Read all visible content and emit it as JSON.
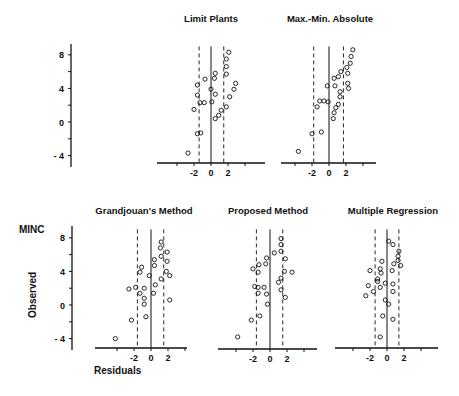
{
  "figure": {
    "ylabel": "Observed",
    "xlabel": "Residuals",
    "corner_label": "MINC",
    "y_ticks": [
      "8",
      "4",
      "0",
      "- 4"
    ],
    "x_ticks": [
      "-2",
      "0",
      "2"
    ]
  },
  "chart_data": [
    {
      "type": "scatter",
      "title": "Limit  Plants",
      "xlabel": "Residuals",
      "ylabel": "Observed",
      "xlim": [
        -6,
        6
      ],
      "ylim": [
        -5,
        9
      ],
      "x_ticks": [
        -2,
        0,
        2
      ],
      "y_ticks": [
        -4,
        0,
        4,
        8
      ],
      "dashed_bounds": [
        -1.4,
        1.5
      ],
      "points": [
        [
          2.1,
          8.3
        ],
        [
          1.8,
          7.5
        ],
        [
          1.8,
          6.6
        ],
        [
          1.8,
          5.7
        ],
        [
          2.9,
          4.6
        ],
        [
          2.7,
          3.9
        ],
        [
          2.2,
          3.0
        ],
        [
          0.5,
          5.8
        ],
        [
          0.4,
          5.2
        ],
        [
          -0.7,
          5.1
        ],
        [
          -1.6,
          4.4
        ],
        [
          0.0,
          3.9
        ],
        [
          0.5,
          3.3
        ],
        [
          -1.6,
          3.2
        ],
        [
          -1.3,
          2.3
        ],
        [
          -0.8,
          2.3
        ],
        [
          0.1,
          2.4
        ],
        [
          -2.0,
          1.5
        ],
        [
          1.8,
          1.8
        ],
        [
          1.2,
          1.4
        ],
        [
          0.9,
          0.8
        ],
        [
          0.5,
          0.4
        ],
        [
          -1.6,
          -1.4
        ],
        [
          -1.2,
          -1.3
        ],
        [
          -2.7,
          -3.7
        ]
      ]
    },
    {
      "type": "scatter",
      "title": "Max.-Min. Absolute",
      "xlabel": "Residuals",
      "ylabel": "Observed",
      "xlim": [
        -6,
        6
      ],
      "ylim": [
        -5,
        9
      ],
      "x_ticks": [
        -2,
        0,
        2
      ],
      "y_ticks": [
        -4,
        0,
        4,
        8
      ],
      "dashed_bounds": [
        -1.8,
        1.7
      ],
      "points": [
        [
          2.8,
          8.6
        ],
        [
          2.6,
          7.8
        ],
        [
          2.5,
          7.0
        ],
        [
          2.1,
          6.5
        ],
        [
          1.4,
          6.0
        ],
        [
          2.2,
          5.8
        ],
        [
          1.1,
          5.4
        ],
        [
          0.6,
          5.2
        ],
        [
          2.2,
          4.6
        ],
        [
          2.3,
          4.0
        ],
        [
          -0.2,
          4.3
        ],
        [
          0.7,
          4.3
        ],
        [
          1.3,
          3.6
        ],
        [
          1.3,
          3.0
        ],
        [
          -1.1,
          2.5
        ],
        [
          -0.6,
          2.5
        ],
        [
          -0.1,
          2.4
        ],
        [
          1.1,
          2.1
        ],
        [
          -1.4,
          1.8
        ],
        [
          0.8,
          1.7
        ],
        [
          0.6,
          1.1
        ],
        [
          0.5,
          0.4
        ],
        [
          -0.9,
          -1.2
        ],
        [
          -2.0,
          -1.4
        ],
        [
          -3.6,
          -3.5
        ]
      ]
    },
    {
      "type": "scatter",
      "title": "Grandjouan's  Method",
      "xlabel": "Residuals",
      "ylabel": "Observed",
      "xlim": [
        -6,
        6
      ],
      "ylim": [
        -5,
        9
      ],
      "x_ticks": [
        -2,
        0,
        2
      ],
      "y_ticks": [
        -4,
        0,
        4,
        8
      ],
      "dashed_bounds": [
        -1.6,
        1.5
      ],
      "points": [
        [
          1.2,
          7.5
        ],
        [
          1.1,
          6.8
        ],
        [
          1.9,
          6.3
        ],
        [
          1.2,
          5.8
        ],
        [
          0.4,
          5.4
        ],
        [
          1.9,
          5.2
        ],
        [
          0.4,
          4.7
        ],
        [
          -1.1,
          4.5
        ],
        [
          -1.3,
          3.9
        ],
        [
          1.8,
          4.0
        ],
        [
          2.2,
          3.5
        ],
        [
          -0.2,
          3.5
        ],
        [
          1.2,
          3.1
        ],
        [
          0.5,
          2.4
        ],
        [
          -1.8,
          2.1
        ],
        [
          -2.6,
          1.9
        ],
        [
          -0.8,
          2.0
        ],
        [
          -1.3,
          1.4
        ],
        [
          0.3,
          1.4
        ],
        [
          -0.8,
          0.8
        ],
        [
          2.2,
          0.6
        ],
        [
          -0.8,
          0.1
        ],
        [
          -0.6,
          -1.4
        ],
        [
          -2.3,
          -1.8
        ],
        [
          -4.2,
          -4.0
        ]
      ]
    },
    {
      "type": "scatter",
      "title": "Proposed  Method",
      "xlabel": "Residuals",
      "ylabel": "Observed",
      "xlim": [
        -6,
        6
      ],
      "ylim": [
        -5,
        9
      ],
      "x_ticks": [
        -2,
        0,
        2
      ],
      "y_ticks": [
        -4,
        0,
        4,
        8
      ],
      "dashed_bounds": [
        -1.6,
        1.5
      ],
      "points": [
        [
          1.3,
          7.9
        ],
        [
          1.3,
          7.2
        ],
        [
          1.3,
          6.4
        ],
        [
          0.5,
          6.2
        ],
        [
          -0.4,
          5.6
        ],
        [
          1.8,
          5.5
        ],
        [
          -0.5,
          4.9
        ],
        [
          -1.3,
          4.8
        ],
        [
          -2.0,
          4.3
        ],
        [
          -1.4,
          3.9
        ],
        [
          1.7,
          4.0
        ],
        [
          2.6,
          3.9
        ],
        [
          1.3,
          3.2
        ],
        [
          1.0,
          2.7
        ],
        [
          -1.8,
          2.2
        ],
        [
          -1.4,
          2.1
        ],
        [
          -0.7,
          2.1
        ],
        [
          1.3,
          1.8
        ],
        [
          -1.4,
          1.4
        ],
        [
          -0.4,
          1.3
        ],
        [
          1.8,
          0.9
        ],
        [
          -0.3,
          0.1
        ],
        [
          -1.2,
          -1.3
        ],
        [
          -2.2,
          -1.8
        ],
        [
          -3.8,
          -3.8
        ]
      ]
    },
    {
      "type": "scatter",
      "title": "Multiple  Regression",
      "xlabel": "Residuals",
      "ylabel": "Observed",
      "xlim": [
        -6,
        6
      ],
      "ylim": [
        -5,
        9
      ],
      "x_ticks": [
        -2,
        0,
        2
      ],
      "y_ticks": [
        -4,
        0,
        4,
        8
      ],
      "dashed_bounds": [
        -1.4,
        1.4
      ],
      "points": [
        [
          0.2,
          7.6
        ],
        [
          0.7,
          7.2
        ],
        [
          1.4,
          6.4
        ],
        [
          1.3,
          5.8
        ],
        [
          1.3,
          5.3
        ],
        [
          -0.6,
          5.2
        ],
        [
          0.8,
          4.9
        ],
        [
          1.6,
          4.7
        ],
        [
          -0.8,
          4.3
        ],
        [
          -2.0,
          4.1
        ],
        [
          0.6,
          4.1
        ],
        [
          -0.7,
          3.8
        ],
        [
          -1.1,
          3.1
        ],
        [
          -1.1,
          2.8
        ],
        [
          -0.2,
          2.6
        ],
        [
          0.7,
          2.5
        ],
        [
          -2.2,
          2.3
        ],
        [
          -0.8,
          2.1
        ],
        [
          -1.6,
          1.6
        ],
        [
          0.7,
          1.6
        ],
        [
          -2.5,
          1.1
        ],
        [
          -0.2,
          0.6
        ],
        [
          0.2,
          0.1
        ],
        [
          -0.5,
          -1.3
        ],
        [
          0.7,
          -1.7
        ],
        [
          -0.8,
          -3.8
        ]
      ]
    }
  ]
}
